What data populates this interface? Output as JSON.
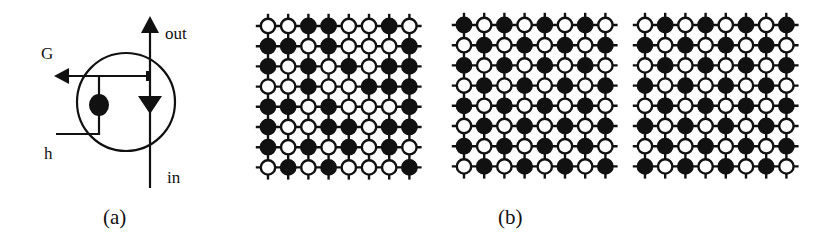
{
  "panel_a": {
    "caption": "(a)",
    "labels": {
      "gate": "G",
      "output": "out",
      "input": "in",
      "field": "h"
    }
  },
  "panel_b": {
    "caption": "(b)",
    "legend": {
      "filled": "filled node (state 1)",
      "open": "open node (state 0)"
    },
    "grids": [
      {
        "name": "random-configuration",
        "rows": [
          "OOFFOOFO",
          "FFOFOOOF",
          "FOFOFOFF",
          "OOFOOFFF",
          "FFOFOOOF",
          "FOOFFOFF",
          "FOFOFOFO",
          "OFOFOOOF"
        ]
      },
      {
        "name": "checkerboard-configuration",
        "rows": [
          "FOFOFOFO",
          "OFOFOFOF",
          "FOFOFOFO",
          "OFOFOFOF",
          "FOFOFOFO",
          "OFOFOFOF",
          "FOFOFOFO",
          "OFOFOFOF"
        ]
      },
      {
        "name": "inverse-checkerboard-configuration",
        "rows": [
          "OFOFOFOF",
          "FOFOFOFO",
          "OFOFOFOF",
          "FOFOFOFO",
          "OFOFOFOF",
          "FOFOFOFO",
          "OFOFOFOF",
          "FOFOFOFO"
        ]
      }
    ]
  },
  "colors": {
    "ink": "#111111",
    "background": "#ffffff"
  }
}
